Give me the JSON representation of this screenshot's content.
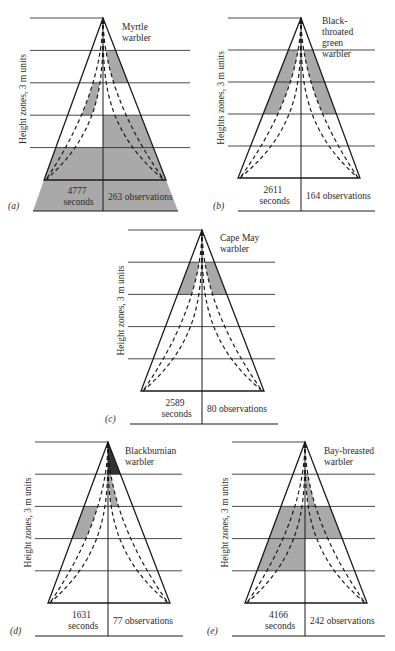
{
  "figure": {
    "y_axis_label_a": "Height zones, 3 m units",
    "y_axis_label_b": "Heights zones, 3 m units",
    "shade_color": "#a9a9a9",
    "line_color": "#1a1a1a"
  },
  "chart_data": {
    "type": "diagram",
    "panels": [
      {
        "id": "a",
        "letter": "(a)",
        "species": [
          "Myrtle",
          "warbler"
        ],
        "seconds": "4777",
        "seconds_label": "seconds",
        "observations": "263 observations",
        "ylabel": "Height zones, 3 m units",
        "shaded": [
          {
            "zone": 2,
            "side": "R",
            "part": "outer"
          },
          {
            "zone": 3,
            "side": "L",
            "part": "inner"
          },
          {
            "zone": 4,
            "side": "R",
            "part": "full"
          },
          {
            "zone": 5,
            "side": "L",
            "part": "full"
          },
          {
            "zone": 5,
            "side": "R",
            "part": "full"
          },
          {
            "zone": 6,
            "side": "L",
            "part": "full"
          },
          {
            "zone": 6,
            "side": "R",
            "part": "full"
          }
        ]
      },
      {
        "id": "b",
        "letter": "(b)",
        "species": [
          "Black-",
          "throated",
          "green",
          "warbler"
        ],
        "seconds": "2611",
        "seconds_label": "seconds",
        "observations": "164 observations",
        "ylabel": "Heights zones, 3 m units",
        "shaded": [
          {
            "zone": 2,
            "side": "L",
            "part": "outer"
          },
          {
            "zone": 2,
            "side": "R",
            "part": "outer"
          },
          {
            "zone": 3,
            "side": "L",
            "part": "outer"
          },
          {
            "zone": 3,
            "side": "R",
            "part": "outer"
          }
        ]
      },
      {
        "id": "c",
        "letter": "(c)",
        "species": [
          "Cape May",
          "warbler"
        ],
        "seconds": "2589",
        "seconds_label": "seconds",
        "observations": "80 observations",
        "ylabel": "Height zones, 3 m units",
        "shaded": [
          {
            "zone": 2,
            "side": "L",
            "part": "outer"
          },
          {
            "zone": 2,
            "side": "R",
            "part": "outer"
          }
        ]
      },
      {
        "id": "d",
        "letter": "(d)",
        "species": [
          "Blackburnian",
          "warbler"
        ],
        "seconds": "1631",
        "seconds_label": "seconds",
        "observations": "77 observations",
        "ylabel": "Height zones, 3 m units",
        "shaded": [
          {
            "zone": 1,
            "side": "R",
            "part": "apex"
          },
          {
            "zone": 2,
            "side": "R",
            "part": "inner"
          },
          {
            "zone": 3,
            "side": "L",
            "part": "outer"
          }
        ]
      },
      {
        "id": "e",
        "letter": "(e)",
        "species": [
          "Bay-breasted",
          "warbler"
        ],
        "seconds": "4166",
        "seconds_label": "seconds",
        "observations": "242 observations",
        "ylabel": "Height zones, 3 m units",
        "shaded": [
          {
            "zone": 2,
            "side": "R",
            "part": "inner"
          },
          {
            "zone": 3,
            "side": "L",
            "part": "full"
          },
          {
            "zone": 3,
            "side": "R",
            "part": "full"
          },
          {
            "zone": 4,
            "side": "L",
            "part": "full"
          }
        ]
      }
    ]
  },
  "layout": [
    {
      "id": "a",
      "x0": 30,
      "lineL": 30,
      "lineR": 190,
      "apexX": 103,
      "top": 18,
      "base": 180,
      "bottom": 211,
      "baseL": 44,
      "baseR": 166,
      "bottomL": 33,
      "bottomR": 178,
      "labelX": 122,
      "labelY": 30
    },
    {
      "id": "b",
      "x0": 228,
      "lineL": 228,
      "lineR": 375,
      "apexX": 301,
      "top": 18,
      "base": 178,
      "bottom": 211,
      "baseL": 238,
      "baseR": 360,
      "bottomL": 238,
      "bottomR": 375,
      "labelX": 322,
      "labelY": 24
    },
    {
      "id": "c",
      "x0": 128,
      "lineL": 128,
      "lineR": 275,
      "apexX": 202,
      "top": 230,
      "base": 391,
      "bottom": 424,
      "baseL": 141,
      "baseR": 264,
      "bottomL": 130,
      "bottomR": 278,
      "labelX": 220,
      "labelY": 241
    },
    {
      "id": "d",
      "x0": 35,
      "lineL": 35,
      "lineR": 182,
      "apexX": 108,
      "top": 442,
      "base": 603,
      "bottom": 636,
      "baseL": 48,
      "baseR": 170,
      "bottomL": 35,
      "bottomR": 183,
      "labelX": 125,
      "labelY": 454
    },
    {
      "id": "e",
      "x0": 232,
      "lineL": 232,
      "lineR": 375,
      "apexX": 305,
      "top": 442,
      "base": 603,
      "bottom": 636,
      "baseL": 245,
      "baseR": 367,
      "bottomL": 232,
      "bottomR": 385,
      "labelX": 324,
      "labelY": 454
    }
  ]
}
